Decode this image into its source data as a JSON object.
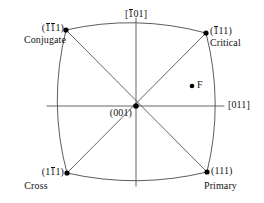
{
  "figure": {
    "type": "stereographic-projection",
    "background_color": "#ffffff",
    "line_color": "#4a4a4a",
    "text_color": "#141414",
    "marker_color": "#000000"
  },
  "poles": {
    "top_direction": {
      "prefix": "[",
      "bar_digit": "1",
      "rest": "01",
      "suffix": "]",
      "text": "[-101]"
    },
    "right_direction": {
      "prefix": "[",
      "rest": "011",
      "suffix": "]",
      "text": "[011]"
    },
    "center": {
      "prefix": "(",
      "rest": "001",
      "suffix": ")",
      "text": "(001)"
    }
  },
  "slip_systems": [
    {
      "id": "conjugate",
      "position": "top-left",
      "index_open": "(",
      "index_bar1": "1",
      "index_bar2": "1",
      "index_tail": "1",
      "index_close": ")",
      "index_text": "(-1-11)",
      "name": "Conjugate"
    },
    {
      "id": "critical",
      "position": "top-right",
      "index_open": "(",
      "index_bar1": "1",
      "index_tail": "11",
      "index_close": ")",
      "index_text": "(-111)",
      "name": "Critical"
    },
    {
      "id": "cross",
      "position": "bottom-left",
      "index_open": "(1",
      "index_bar1": "1",
      "index_tail": "1",
      "index_close": ")",
      "index_text": "(1-11)",
      "name": "Cross"
    },
    {
      "id": "primary",
      "position": "bottom-right",
      "index_open": "(",
      "index_tail": "111",
      "index_close": ")",
      "index_text": "(111)",
      "name": "Primary"
    }
  ],
  "points": [
    {
      "id": "pole-conjugate",
      "label": "",
      "x": 66,
      "y": 30
    },
    {
      "id": "pole-critical",
      "label": "",
      "x": 206,
      "y": 33
    },
    {
      "id": "pole-cross",
      "label": "",
      "x": 67,
      "y": 173
    },
    {
      "id": "pole-primary",
      "label": "",
      "x": 207,
      "y": 172
    },
    {
      "id": "pole-center",
      "label": "",
      "x": 136,
      "y": 106
    },
    {
      "id": "point-f",
      "label": "F",
      "x": 192,
      "y": 86
    }
  ],
  "annotations": {
    "f_label": "F"
  }
}
